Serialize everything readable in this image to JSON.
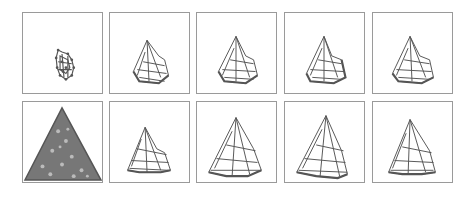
{
  "figure": {
    "rows": 2,
    "cols": 5,
    "colors": {
      "border": "#9a9a9a",
      "mesh": "#555555",
      "background": "#ffffff"
    },
    "panels": [
      {
        "row": 1,
        "col": 1,
        "shape": "small-blob"
      },
      {
        "row": 1,
        "col": 2,
        "shape": "triangular-mesh"
      },
      {
        "row": 1,
        "col": 3,
        "shape": "triangular-mesh"
      },
      {
        "row": 1,
        "col": 4,
        "shape": "triangular-mesh"
      },
      {
        "row": 1,
        "col": 5,
        "shape": "triangular-mesh"
      },
      {
        "row": 2,
        "col": 1,
        "shape": "dense-triangle-points"
      },
      {
        "row": 2,
        "col": 2,
        "shape": "triangular-mesh"
      },
      {
        "row": 2,
        "col": 3,
        "shape": "triangular-mesh"
      },
      {
        "row": 2,
        "col": 4,
        "shape": "triangular-mesh"
      },
      {
        "row": 2,
        "col": 5,
        "shape": "triangular-mesh"
      }
    ]
  }
}
